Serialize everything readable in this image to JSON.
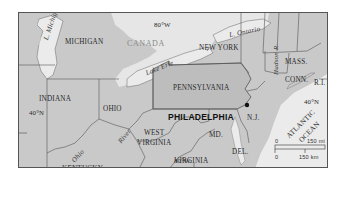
{
  "map": {
    "title": "Philadelphia region map",
    "city": {
      "name": "PHILADELPHIA",
      "marker": "city-dot"
    },
    "states": {
      "michigan": "MICHIGAN",
      "new_york": "NEW YORK",
      "pennsylvania": "PENNSYLVANIA",
      "indiana": "INDIANA",
      "ohio": "OHIO",
      "west_virginia_1": "WEST",
      "west_virginia_2": "VIRGINIA",
      "virginia": "VIRGINIA",
      "kentucky": "KENTUCKY",
      "maryland": "MD.",
      "delaware": "DEL.",
      "new_jersey": "N.J.",
      "massachusetts": "MASS.",
      "connecticut": "CONN.",
      "rhode_island": "R.I."
    },
    "country": "CANADA",
    "water": {
      "lake_michigan": "L. Michigan",
      "lake_ontario": "L. Ontario",
      "lake_erie": "Lake Erie",
      "hudson": "Hudson R.",
      "ohio_river_1": "Ohio",
      "ohio_river_2": "River",
      "ocean_1": "ATLANTIC",
      "ocean_2": "OCEAN"
    },
    "gridlines": {
      "lon_top": "80°W",
      "lon_bottom": "80°W",
      "lat_left": "40°N",
      "lat_right": "40°N"
    },
    "scale": {
      "top_zero": "0",
      "top_label": "150 mi",
      "bottom_zero": "0",
      "bottom_label": "150 km"
    },
    "colors": {
      "land": "#c9c9c9",
      "pennsylvania": "#bdbdbd",
      "water": "#ebebeb",
      "border": "#555555"
    }
  }
}
